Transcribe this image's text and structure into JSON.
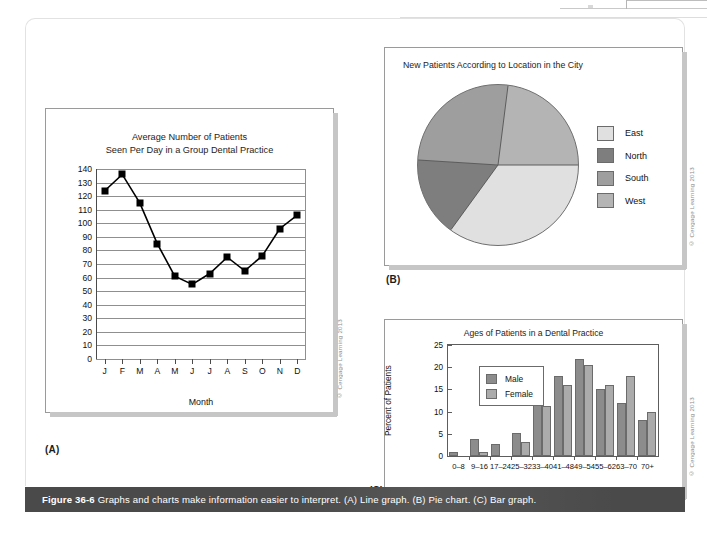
{
  "page": {
    "caption_figure": "Figure 36-6",
    "caption_text": "Graphs and charts make information easier to interpret. (A) Line graph. (B) Pie chart. (C) Bar graph.",
    "copyright": "© Cengage Learning 2013"
  },
  "panelA": {
    "label": "(A)",
    "title_line1": "Average Number of Patients",
    "title_line2": "Seen Per Day in a Group Dental Practice",
    "xlabel": "Month"
  },
  "panelB": {
    "label": "(B)",
    "title": "New Patients According to Location in the City",
    "legend": [
      {
        "label": "East",
        "color": "#e0e0e0"
      },
      {
        "label": "North",
        "color": "#7e7e7e"
      },
      {
        "label": "South",
        "color": "#9e9e9e"
      },
      {
        "label": "West",
        "color": "#b4b4b4"
      }
    ]
  },
  "panelC": {
    "label": "(C)",
    "title": "Ages of Patients in a Dental Practice",
    "ylabel": "Percent of Patients",
    "legend": [
      {
        "label": "Male",
        "color": "#8c8c8c"
      },
      {
        "label": "Female",
        "color": "#ababab"
      }
    ]
  },
  "chart_data": [
    {
      "id": "line-graph",
      "type": "line",
      "title": "Average Number of Patients Seen Per Day in a Group Dental Practice",
      "xlabel": "Month",
      "ylabel": "",
      "categories": [
        "J",
        "F",
        "M",
        "A",
        "M",
        "J",
        "J",
        "A",
        "S",
        "O",
        "N",
        "D"
      ],
      "values": [
        124,
        136,
        115,
        85,
        61,
        55,
        63,
        75,
        65,
        76,
        96,
        106
      ],
      "ylim": [
        0,
        140
      ],
      "yticks": [
        0,
        10,
        20,
        30,
        40,
        50,
        60,
        70,
        80,
        90,
        100,
        110,
        120,
        130,
        140
      ],
      "grid": true,
      "marker": "square",
      "legend": "none"
    },
    {
      "id": "pie-chart",
      "type": "pie",
      "title": "New Patients According to Location in the City",
      "labels": [
        "East",
        "North",
        "South",
        "West"
      ],
      "values": [
        35,
        16,
        26,
        23
      ],
      "colors": [
        "#e0e0e0",
        "#7e7e7e",
        "#9e9e9e",
        "#b4b4b4"
      ],
      "start_angle_deg": 90,
      "legend": "right"
    },
    {
      "id": "bar-chart",
      "type": "bar",
      "title": "Ages of Patients in a Dental Practice",
      "xlabel": "",
      "ylabel": "Percent of Patients",
      "categories": [
        "0–8",
        "9–16",
        "17–24",
        "25–32",
        "33–40",
        "41–48",
        "49–54",
        "55–62",
        "63–70",
        "70+"
      ],
      "series": [
        {
          "name": "Male",
          "color": "#8c8c8c",
          "values": [
            1,
            3.8,
            2.6,
            5.1,
            14,
            18,
            21.8,
            15.1,
            12,
            8
          ]
        },
        {
          "name": "Female",
          "color": "#ababab",
          "values": [
            0,
            0.8,
            0,
            3.2,
            11.2,
            15.9,
            20.5,
            16,
            18,
            10
          ]
        }
      ],
      "ylim": [
        0,
        25
      ],
      "yticks": [
        0,
        5,
        10,
        15,
        20,
        25
      ],
      "grid": false,
      "legend": "inside-upper-left"
    }
  ]
}
